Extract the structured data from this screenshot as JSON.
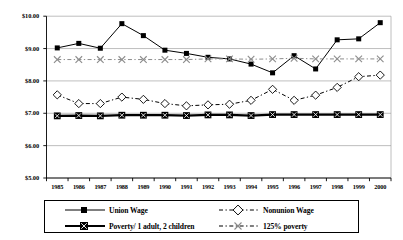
{
  "chart_data": {
    "type": "line",
    "title": "",
    "xlabel": "",
    "ylabel": "",
    "grid": true,
    "legend_position": "bottom",
    "ylim": [
      5.0,
      10.0
    ],
    "ytick_values": [
      10.0,
      9.0,
      8.0,
      7.0,
      6.0,
      5.0
    ],
    "ytick_labels": [
      "$10.00",
      "$9.00",
      "$8.00",
      "$7.00",
      "$6.00",
      "$5.00"
    ],
    "categories": [
      "1985",
      "1986",
      "1987",
      "1988",
      "1989",
      "1990",
      "1991",
      "1992",
      "1993",
      "1994",
      "1995",
      "1996",
      "1997",
      "1998",
      "1999",
      "2000"
    ],
    "series": [
      {
        "name": "Union Wage",
        "marker": "filled-square",
        "line": "solid",
        "color": "#000000",
        "values": [
          9.02,
          9.16,
          9.01,
          9.77,
          9.4,
          8.95,
          8.85,
          8.73,
          8.68,
          8.52,
          8.25,
          8.78,
          8.37,
          9.27,
          9.3,
          9.8
        ]
      },
      {
        "name": "Nonunion Wage",
        "marker": "open-diamond",
        "line": "dash-dot",
        "color": "#000000",
        "values": [
          7.57,
          7.3,
          7.3,
          7.5,
          7.43,
          7.3,
          7.23,
          7.26,
          7.28,
          7.4,
          7.74,
          7.4,
          7.56,
          7.8,
          8.13,
          8.18
        ]
      },
      {
        "name": "Poverty/ 1 adult, 2 children",
        "marker": "filled-square-x",
        "line": "solid-thick",
        "color": "#000000",
        "values": [
          6.92,
          6.93,
          6.92,
          6.94,
          6.94,
          6.94,
          6.93,
          6.95,
          6.95,
          6.93,
          6.96,
          6.96,
          6.96,
          6.96,
          6.96,
          6.96
        ]
      },
      {
        "name": "125% poverty",
        "marker": "open-x",
        "line": "dash-dot",
        "color": "#8c8c8c",
        "values": [
          8.66,
          8.66,
          8.66,
          8.66,
          8.66,
          8.66,
          8.66,
          8.68,
          8.68,
          8.67,
          8.68,
          8.7,
          8.68,
          8.68,
          8.68,
          8.68
        ]
      }
    ]
  },
  "legend": {
    "items": [
      {
        "label": "Union Wage",
        "marker": "filled-square",
        "style": "solid"
      },
      {
        "label": "Nonunion Wage",
        "marker": "open-diamond",
        "style": "dash-dot"
      },
      {
        "label": "Poverty/ 1 adult, 2 children",
        "marker": "filled-square-x",
        "style": "solid-thick"
      },
      {
        "label": "125% poverty",
        "marker": "open-x",
        "style": "dash-dot"
      }
    ]
  },
  "colors": {
    "axis": "#000000",
    "grid": "#9a9a9a",
    "series_dark": "#000000",
    "series_gray": "#8c8c8c",
    "background": "#ffffff"
  }
}
